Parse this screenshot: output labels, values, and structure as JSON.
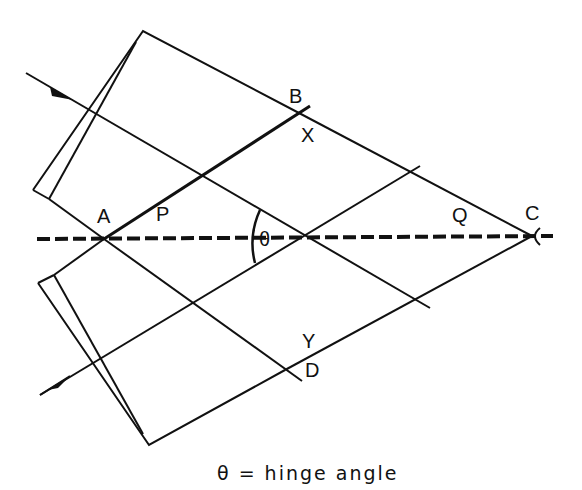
{
  "diagram": {
    "labels": {
      "A": "A",
      "B": "B",
      "C": "C",
      "D": "D",
      "P": "P",
      "Q": "Q",
      "X": "X",
      "Y": "Y",
      "theta": "θ"
    },
    "caption": "θ = hinge angle",
    "colors": {
      "stroke": "#111111",
      "background": "#ffffff"
    }
  }
}
